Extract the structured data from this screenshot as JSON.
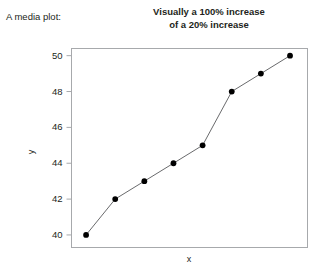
{
  "caption": "A media plot:",
  "chart_data": {
    "type": "line",
    "title": "Visually a 100% increase of a 20% increase",
    "title_lines": [
      "Visually a 100% increase",
      "of a 20% increase"
    ],
    "xlabel": "x",
    "ylabel": "y",
    "x": [
      1,
      2,
      3,
      4,
      5,
      6,
      7,
      8
    ],
    "values": [
      40,
      42,
      43,
      44,
      45,
      48,
      49,
      50
    ],
    "series": [
      {
        "name": "y",
        "values": [
          40,
          42,
          43,
          44,
          45,
          48,
          49,
          50
        ]
      }
    ],
    "ylim": [
      39.3,
      50.4
    ],
    "xlim": [
      0.5,
      8.6
    ],
    "yticks": [
      40,
      42,
      44,
      46,
      48,
      50
    ],
    "ytick_labels": [
      "40",
      "42",
      "44",
      "46",
      "48",
      "50"
    ],
    "xticks": [],
    "xtick_labels": [],
    "grid": false,
    "legend": false,
    "marker": "filled-circle",
    "marker_color": "#000000",
    "line_color": "#58595b",
    "frame_color": "#a7a9ac",
    "background": "#ffffff"
  }
}
